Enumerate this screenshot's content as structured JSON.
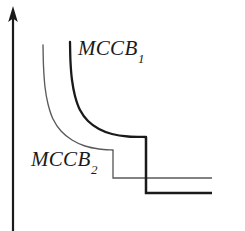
{
  "figure": {
    "background_color": "#ffffff",
    "ink_color": "#1a1a1a",
    "thin_color": "#5a5a5a",
    "axis": {
      "name": "vertical-axis-arrow",
      "orientation": "vertical",
      "has_arrowhead": true
    },
    "labels": {
      "mccb1": {
        "base": "MCCB",
        "subscript": "1"
      },
      "mccb2": {
        "base": "MCCB",
        "subscript": "2"
      }
    }
  },
  "chart_data": {
    "type": "line",
    "title": "",
    "xlabel": "",
    "ylabel": "",
    "grid": false,
    "legend": "inline-annotations",
    "axis_style": "single vertical arrow axis, no tick labels",
    "series": [
      {
        "name": "MCCB₁",
        "label": "MCCB1",
        "line_width": "thick",
        "color": "#1a1a1a",
        "inverse_time_curve": [
          [
            70,
            42
          ],
          [
            70.5,
            62
          ],
          [
            72,
            80
          ],
          [
            75,
            96
          ],
          [
            80,
            110
          ],
          [
            88,
            121
          ],
          [
            99,
            129
          ],
          [
            112,
            134
          ],
          [
            128,
            136.5
          ],
          [
            146,
            137
          ]
        ],
        "instantaneous_step": {
          "x": 146,
          "y_from": 137,
          "y_to": 193
        },
        "short_circuit_tail": {
          "y": 193,
          "x_from": 146,
          "x_to": 212
        }
      },
      {
        "name": "MCCB₂",
        "label": "MCCB2",
        "line_width": "thin",
        "color": "#5a5a5a",
        "inverse_time_curve": [
          [
            43,
            45
          ],
          [
            43.5,
            66
          ],
          [
            45,
            87
          ],
          [
            48,
            104
          ],
          [
            53,
            119
          ],
          [
            61,
            131
          ],
          [
            72,
            140
          ],
          [
            85,
            146
          ],
          [
            99,
            149
          ],
          [
            113,
            150
          ]
        ],
        "instantaneous_step": {
          "x": 113,
          "y_from": 150,
          "y_to": 178
        },
        "short_circuit_tail": {
          "y": 178,
          "x_from": 113,
          "x_to": 212
        }
      }
    ],
    "axis_line": {
      "x": 13,
      "y_top": 8,
      "y_bottom": 231
    }
  }
}
